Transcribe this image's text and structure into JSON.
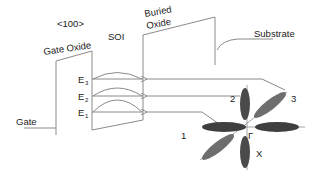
{
  "labels": {
    "crystal_direction": "<100>",
    "gate_oxide": "Gate Oxide",
    "soi": "SOI",
    "buried_oxide_line1": "Buried",
    "buried_oxide_line2": "Oxide",
    "substrate": "Substrate",
    "gate": "Gate"
  },
  "energy_levels": [
    {
      "base": "E",
      "sub": "3"
    },
    {
      "base": "E",
      "sub": "2"
    },
    {
      "base": "E",
      "sub": "1"
    }
  ],
  "valleys": {
    "v1": "1",
    "v2": "2",
    "v3": "3",
    "gamma": "Γ",
    "x": "X"
  },
  "colors": {
    "line": "#8a8a8a",
    "ellipse_dark": "#3f3f3f",
    "ellipse_mid": "#6e6e6e",
    "text": "#222222"
  }
}
